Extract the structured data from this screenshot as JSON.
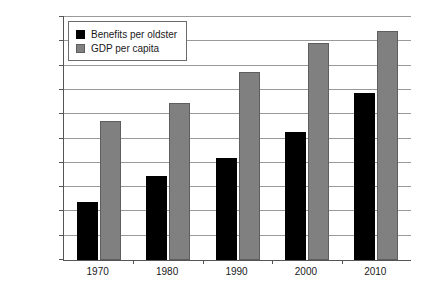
{
  "chart_data": {
    "type": "bar",
    "title": "",
    "subtitle": "",
    "xlabel": "",
    "ylabel": "",
    "categories": [
      "1970",
      "1980",
      "1990",
      "2000",
      "2010"
    ],
    "series": [
      {
        "name": "Benefits per oldster",
        "color": "#000000",
        "values": [
          12000,
          17300,
          21000,
          26400,
          34400
        ]
      },
      {
        "name": "GDP per capita",
        "color": "#808080",
        "values": [
          28600,
          32400,
          38600,
          44600,
          47200
        ]
      }
    ],
    "ylim": [
      0,
      50000
    ],
    "ytick_step": 5000,
    "ytick_labels": [
      "$0",
      "$5,000",
      "$10,000",
      "$15,000",
      "$20,000",
      "$25,000",
      "$30,000",
      "$35,000",
      "$40,000",
      "$45,000",
      "$50,000"
    ],
    "ytick_values": [
      0,
      5000,
      10000,
      15000,
      20000,
      25000,
      30000,
      35000,
      40000,
      45000,
      50000
    ],
    "grid": true,
    "grid_axis": "y",
    "legend_position": "top-left",
    "legend_entries": [
      "Benefits per oldster",
      "GDP per capita"
    ]
  }
}
